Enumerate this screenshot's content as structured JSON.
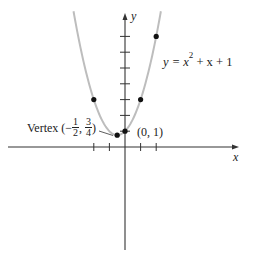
{
  "chart_data": {
    "type": "line",
    "title": "",
    "xlabel": "x",
    "ylabel": "y",
    "equation": "y = x^2 + x + 1",
    "series": [
      {
        "name": "y = x^2 + x + 1",
        "kind": "curve",
        "color": "#bdbdbd",
        "x": [
          -3.25,
          -3,
          -2.5,
          -2,
          -1.5,
          -1,
          -0.5,
          0,
          0.5,
          1,
          1.5,
          2,
          2.25
        ],
        "y": [
          8.31,
          7,
          4.75,
          3,
          1.75,
          1,
          0.75,
          1,
          1.75,
          3,
          4.75,
          7,
          8.31
        ]
      },
      {
        "name": "plotted points",
        "kind": "scatter",
        "color": "#111111",
        "x": [
          -2,
          -0.5,
          0,
          1,
          2
        ],
        "y": [
          3,
          0.75,
          1,
          3,
          7
        ]
      }
    ],
    "annotations": [
      {
        "text": "Vertex (−1/2, 3/4)",
        "x": -0.5,
        "y": 0.75
      },
      {
        "text": "(0, 1)",
        "x": 0,
        "y": 1
      },
      {
        "text": "y = x² + x + 1",
        "x": 3,
        "y": 5.5
      }
    ],
    "x_ticks": [
      -2,
      -1,
      1,
      2
    ],
    "y_ticks": [
      1,
      2,
      3,
      4,
      5,
      6,
      7
    ],
    "xlim": [
      -7.5,
      7.3
    ],
    "ylim": [
      -6.7,
      8.5
    ],
    "grid": false,
    "legend": "none"
  },
  "labels": {
    "x_axis": "x",
    "y_axis": "y",
    "equation_prefix": "y = x",
    "equation_exp": "2",
    "equation_suffix": " + x + 1",
    "vertex_word": "Vertex (−",
    "vertex_num1": "1",
    "vertex_den1": "2",
    "vertex_sep": ", ",
    "vertex_num2": "3",
    "vertex_den2": "4",
    "vertex_close": ")",
    "point_label": "(0, 1)"
  },
  "colors": {
    "curve": "#bdbdbd",
    "axis": "#333333",
    "point": "#111111"
  }
}
